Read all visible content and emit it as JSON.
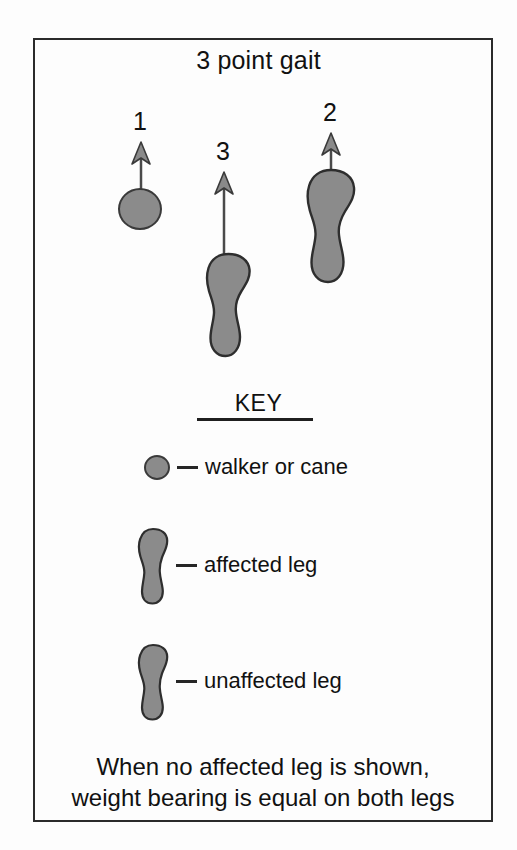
{
  "figure": {
    "title": "3 point gait",
    "caption_line1": "When no affected leg is shown,",
    "caption_line2": "weight bearing is equal on both legs",
    "ink_color": "#111111",
    "shape_fill": "#8b8b8b",
    "shape_stroke": "#3a3a3a",
    "background": "#fdfdfd"
  },
  "steps": [
    {
      "number": "1",
      "mark": "circle",
      "meaning": "walker or cane"
    },
    {
      "number": "3",
      "mark": "footprint",
      "meaning": "affected leg"
    },
    {
      "number": "2",
      "mark": "footprint",
      "meaning": "unaffected leg"
    }
  ],
  "key": {
    "heading": "KEY",
    "items": [
      {
        "icon": "circle-mark",
        "dash": "—",
        "label": "walker or cane"
      },
      {
        "icon": "footprint-mark",
        "dash": "—",
        "label": "affected leg"
      },
      {
        "icon": "footprint-mark",
        "dash": "—",
        "label": "unaffected leg"
      }
    ]
  },
  "bleed_text": {
    "block1": "            \n                    \n                \n                     \n                  \n                 \n                    \n              "
  }
}
